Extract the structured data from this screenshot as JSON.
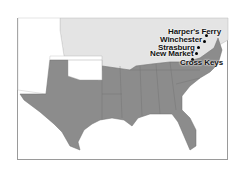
{
  "map": {
    "title": "",
    "colors": {
      "confederate": "#8c8c8c",
      "union": "#e4e4e4",
      "territories": "#ffffff",
      "border": "#6e6e6e",
      "frame": "#9a9a9a"
    },
    "regions": [
      {
        "name": "Confederate States",
        "shade": "dark gray"
      },
      {
        "name": "Union States",
        "shade": "light gray"
      },
      {
        "name": "Western Territories",
        "shade": "white"
      }
    ],
    "locations": [
      {
        "name": "Harper's Ferry",
        "x": 206,
        "y": 34
      },
      {
        "name": "Winchester",
        "x": 204,
        "y": 40
      },
      {
        "name": "Strasburg",
        "x": 198,
        "y": 46
      },
      {
        "name": "New Market",
        "x": 196,
        "y": 52
      },
      {
        "name": "Cross Keys",
        "x": 192,
        "y": 58
      }
    ]
  }
}
